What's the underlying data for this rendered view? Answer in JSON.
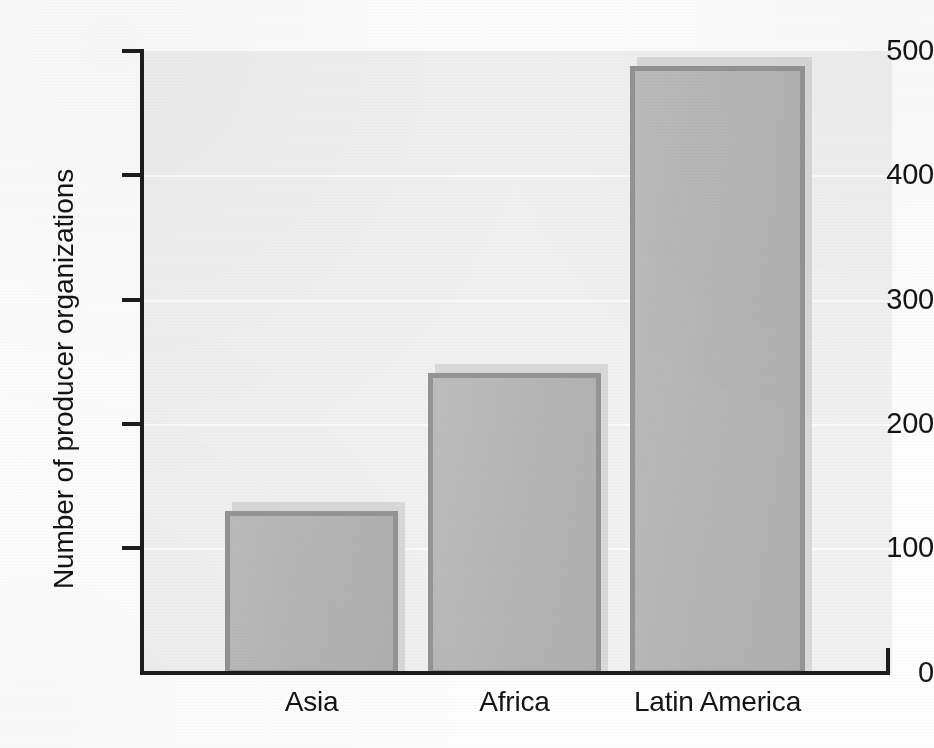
{
  "chart_data": {
    "type": "bar",
    "title": "",
    "subtitle": "",
    "xlabel": "",
    "ylabel": "Number of producer organizations",
    "categories": [
      "Asia",
      "Africa",
      "Latin America"
    ],
    "values": [
      130,
      241,
      488
    ],
    "ylim": [
      0,
      500
    ],
    "yticks": [
      0,
      100,
      200,
      300,
      400,
      500
    ],
    "ytick_labels": [
      "0",
      "100",
      "200",
      "300",
      "400",
      "500"
    ],
    "grid": true,
    "grid_axis": "y",
    "legend": false,
    "legend_position": "none",
    "series": [
      {
        "name": "Number of producer organizations",
        "values": [
          130,
          241,
          488
        ]
      }
    ]
  },
  "style": {
    "bar_fill": "#b4b4b4",
    "bar_border": "#949494",
    "bar_shadow": "#d8d8d8",
    "plot_background": "#f0f0f0",
    "gridline_color": "#fbfbfb",
    "axis_color": "#1d1d1d",
    "text_color": "#141414",
    "page_background": "#fdfdfd"
  }
}
